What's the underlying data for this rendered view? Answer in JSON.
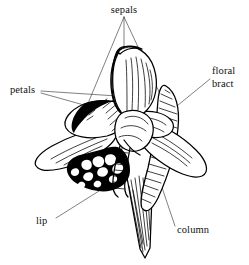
{
  "figure": {
    "type": "labeled-botanical-illustration",
    "style": "black-and-white pen-and-ink line drawing with hatching",
    "background_color": "#ffffff",
    "ink_color": "#000000",
    "leader_line_color": "#2b2b2b"
  },
  "labels": [
    {
      "id": "sepals",
      "text": "sepals",
      "text_x": 124,
      "text_y": 12,
      "anchor": "middle",
      "leader_origin": {
        "x": 124,
        "y": 17
      },
      "leader_targets": [
        {
          "x": 74,
          "y": 137
        },
        {
          "x": 124,
          "y": 52
        },
        {
          "x": 176,
          "y": 128
        }
      ]
    },
    {
      "id": "petals",
      "text": "petals",
      "text_x": 10,
      "text_y": 90,
      "anchor": "start",
      "leader_origin": {
        "x": 41,
        "y": 92
      },
      "leader_targets": [
        {
          "x": 132,
          "y": 97
        },
        {
          "x": 116,
          "y": 113
        }
      ]
    },
    {
      "id": "floral-bract",
      "text": "floral",
      "text_line2": "bract",
      "text_x": 213,
      "text_y": 73,
      "anchor": "start",
      "leader_origin": {
        "x": 210,
        "y": 78
      },
      "leader_targets": [
        {
          "x": 172,
          "y": 110
        }
      ]
    },
    {
      "id": "lip",
      "text": "lip",
      "text_x": 37,
      "text_y": 222,
      "anchor": "start",
      "leader_origin": {
        "x": 55,
        "y": 218
      },
      "leader_targets": [
        {
          "x": 98,
          "y": 192
        }
      ]
    },
    {
      "id": "column",
      "text": "column",
      "text_x": 177,
      "text_y": 231,
      "anchor": "start",
      "leader_origin": {
        "x": 175,
        "y": 226
      },
      "leader_targets": [
        {
          "x": 152,
          "y": 158
        }
      ]
    }
  ],
  "parts": [
    {
      "name": "dorsal-sepal",
      "description": "large hooded upper sepal"
    },
    {
      "name": "lateral-sepal-left",
      "description": "left spreading sepal"
    },
    {
      "name": "lateral-sepal-right",
      "description": "right spreading sepal"
    },
    {
      "name": "petal-left",
      "description": "left lateral petal"
    },
    {
      "name": "petal-right",
      "description": "right lateral petal"
    },
    {
      "name": "lip",
      "description": "fringed labellum below the column"
    },
    {
      "name": "column",
      "description": "central reproductive structure"
    },
    {
      "name": "floral-bract",
      "description": "hatched bract behind the flower"
    },
    {
      "name": "pedicel",
      "description": "tapering stalk at base"
    }
  ]
}
